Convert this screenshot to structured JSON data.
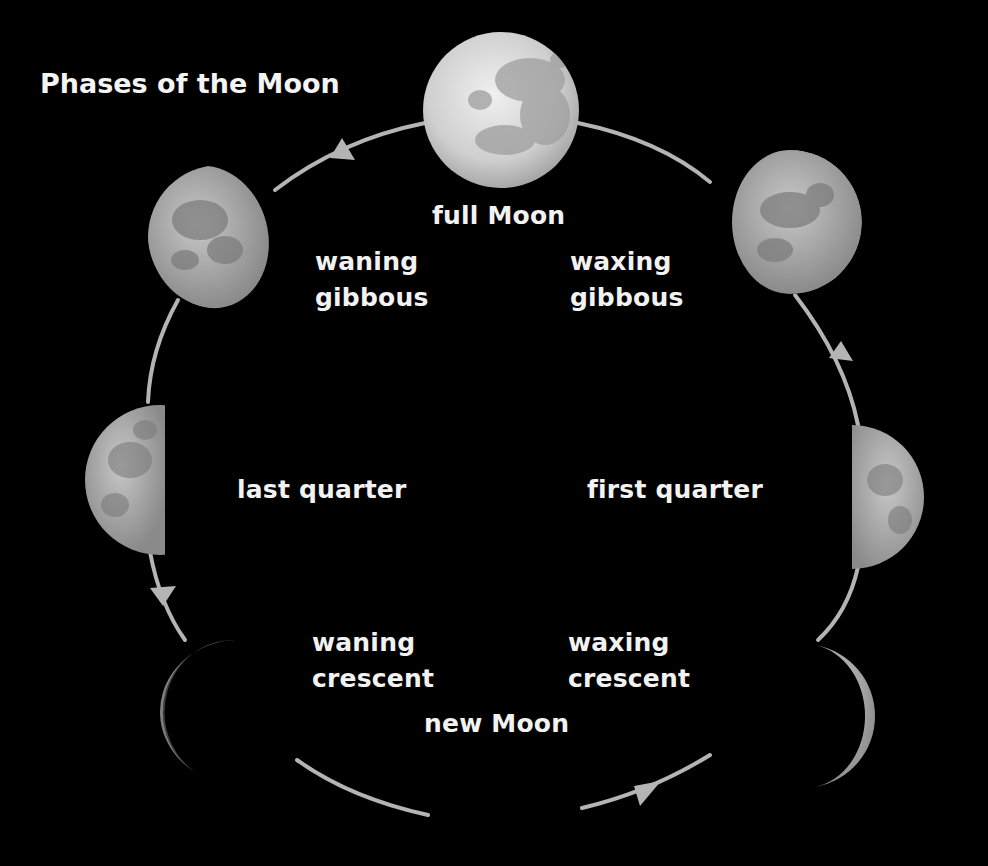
{
  "title": "Phases of the Moon",
  "colors": {
    "background": "#000000",
    "orbit": "#b4b4b4",
    "text": "#f2f2f2",
    "moon_light": "#d8d8d8",
    "moon_mare": "#9a9a9a"
  },
  "phases": [
    {
      "id": "full",
      "label": "full Moon"
    },
    {
      "id": "waxing-gibbous",
      "label_line1": "waxing",
      "label_line2": "gibbous"
    },
    {
      "id": "first-quarter",
      "label": "first quarter"
    },
    {
      "id": "waxing-crescent",
      "label_line1": "waxing",
      "label_line2": "crescent"
    },
    {
      "id": "new",
      "label": "new Moon"
    },
    {
      "id": "waning-crescent",
      "label_line1": "waning",
      "label_line2": "crescent"
    },
    {
      "id": "last-quarter",
      "label": "last quarter"
    },
    {
      "id": "waning-gibbous",
      "label_line1": "waning",
      "label_line2": "gibbous"
    }
  ]
}
